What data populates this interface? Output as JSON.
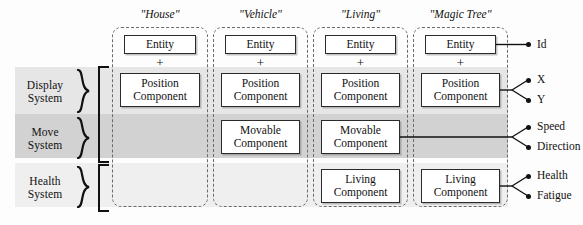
{
  "diagram": {
    "colors": {
      "band_display": "#e6e6e6",
      "band_move": "#d2d2d2",
      "band_health": "#efefef",
      "box_border": "#2b2b2b",
      "column_border": "#6a6a6a",
      "text": "#111111"
    }
  },
  "systems": [
    {
      "id": "display",
      "line1": "Display",
      "line2": "System"
    },
    {
      "id": "move",
      "line1": "Move",
      "line2": "System"
    },
    {
      "id": "health",
      "line1": "Health",
      "line2": "System"
    }
  ],
  "entities": [
    {
      "id": "house",
      "title": "\"House\"",
      "entity_label": "Entity",
      "plus": "+",
      "components": [
        {
          "row": "display",
          "line1": "Position",
          "line2": "Component"
        }
      ]
    },
    {
      "id": "vehicle",
      "title": "\"Vehicle\"",
      "entity_label": "Entity",
      "plus": "+",
      "components": [
        {
          "row": "display",
          "line1": "Position",
          "line2": "Component"
        },
        {
          "row": "move",
          "line1": "Movable",
          "line2": "Component"
        }
      ]
    },
    {
      "id": "living",
      "title": "\"Living\"",
      "entity_label": "Entity",
      "plus": "+",
      "components": [
        {
          "row": "display",
          "line1": "Position",
          "line2": "Component"
        },
        {
          "row": "move",
          "line1": "Movable",
          "line2": "Component"
        },
        {
          "row": "health",
          "line1": "Living",
          "line2": "Component"
        }
      ]
    },
    {
      "id": "magic_tree",
      "title": "\"Magic Tree\"",
      "entity_label": "Entity",
      "plus": "+",
      "components": [
        {
          "row": "display",
          "line1": "Position",
          "line2": "Component"
        },
        {
          "row": "health",
          "line1": "Living",
          "line2": "Component"
        }
      ]
    }
  ],
  "attributes": [
    {
      "id": "id",
      "label": "Id",
      "from": "entity"
    },
    {
      "id": "x",
      "label": "X",
      "from": "position"
    },
    {
      "id": "y",
      "label": "Y",
      "from": "position"
    },
    {
      "id": "speed",
      "label": "Speed",
      "from": "movable"
    },
    {
      "id": "direction",
      "label": "Direction",
      "from": "movable"
    },
    {
      "id": "health",
      "label": "Health",
      "from": "living"
    },
    {
      "id": "fatigue",
      "label": "Fatigue",
      "from": "living"
    }
  ]
}
